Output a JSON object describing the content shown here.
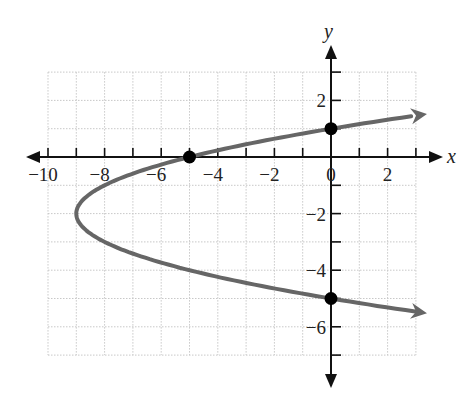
{
  "chart_data": {
    "type": "line",
    "title": "",
    "xlabel": "x",
    "ylabel": "y",
    "xlim": [
      -10,
      3
    ],
    "ylim": [
      -7,
      3
    ],
    "grid": true,
    "equation": "x = (y + 2)^2 - 9",
    "x_tick_labels": [
      {
        "value": -10,
        "label": "−10"
      },
      {
        "value": -8,
        "label": "−8"
      },
      {
        "value": -6,
        "label": "−6"
      },
      {
        "value": -4,
        "label": "−4"
      },
      {
        "value": -2,
        "label": "−2"
      },
      {
        "value": 0,
        "label": "0"
      },
      {
        "value": 2,
        "label": "2"
      }
    ],
    "y_tick_labels": [
      {
        "value": 2,
        "label": "2"
      },
      {
        "value": -2,
        "label": "−2"
      },
      {
        "value": -4,
        "label": "−4"
      },
      {
        "value": -6,
        "label": "−6"
      }
    ],
    "series": [
      {
        "name": "parabola",
        "color": "#666666",
        "curve": {
          "vertex": [
            -9,
            -2
          ],
          "a": 1,
          "opens": "right"
        },
        "y_range": [
          -5.46,
          1.46
        ]
      }
    ],
    "points": [
      {
        "name": "x-intercept",
        "x": -5,
        "y": 0
      },
      {
        "name": "y-intercept-upper",
        "x": 0,
        "y": 1
      },
      {
        "name": "y-intercept-lower",
        "x": 0,
        "y": -5
      }
    ],
    "colors": {
      "axis": "#111111",
      "grid": "#c8c8c8",
      "curve": "#666666",
      "point": "#000000"
    }
  }
}
